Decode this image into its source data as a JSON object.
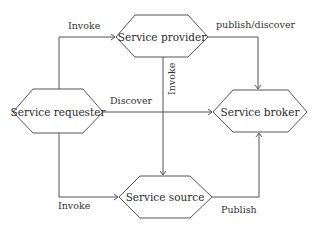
{
  "diagram": {
    "nodes": [
      {
        "id": "requester",
        "label": "Service requester"
      },
      {
        "id": "provider",
        "label": "Service provider"
      },
      {
        "id": "broker",
        "label": "Service broker"
      },
      {
        "id": "source",
        "label": "Service source"
      }
    ],
    "edges": [
      {
        "from": "requester",
        "to": "provider",
        "label": "Invoke"
      },
      {
        "from": "requester",
        "to": "broker",
        "label": "Discover"
      },
      {
        "from": "requester",
        "to": "source",
        "label": "Invoke"
      },
      {
        "from": "provider",
        "to": "broker",
        "label": "publish/discover"
      },
      {
        "from": "provider",
        "to": "source",
        "label": "Invoke"
      },
      {
        "from": "source",
        "to": "broker",
        "label": "Publish"
      }
    ]
  }
}
